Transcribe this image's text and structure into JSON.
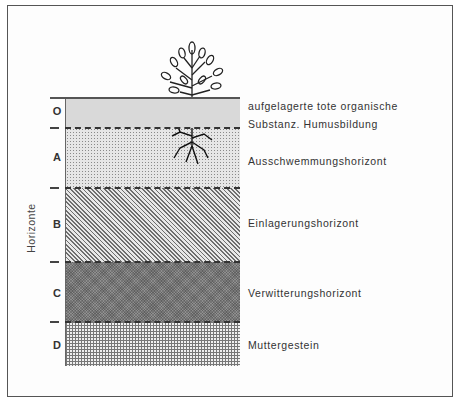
{
  "diagram": {
    "axis_title": "Horizonte",
    "horizons": [
      {
        "letter": "O",
        "description_lines": [
          "aufgelagerte tote organische",
          "Substanz. Humusbildung"
        ],
        "pattern": "light-gray-solid"
      },
      {
        "letter": "A",
        "description_lines": [
          "Ausschwemmungshorizont"
        ],
        "pattern": "fine-dots"
      },
      {
        "letter": "B",
        "description_lines": [
          "Einlagerungshorizont"
        ],
        "pattern": "diagonal-hatch"
      },
      {
        "letter": "C",
        "description_lines": [
          "Verwitterungshorizont"
        ],
        "pattern": "dark-crosshatch"
      },
      {
        "letter": "D",
        "description_lines": [
          "Muttergestein"
        ],
        "pattern": "grid"
      }
    ],
    "illustration": "tree-with-roots"
  }
}
